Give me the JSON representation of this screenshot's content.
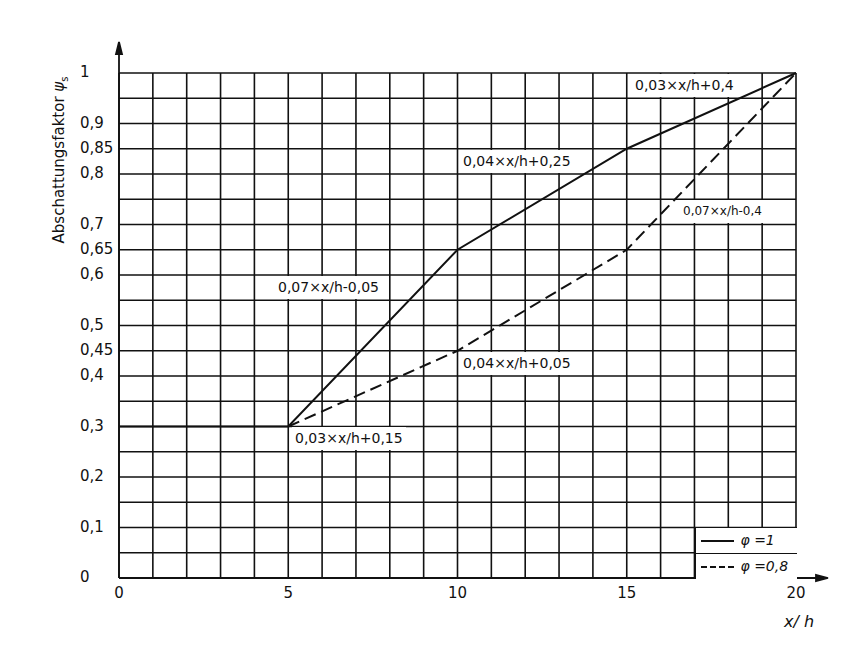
{
  "chart_data": {
    "type": "line",
    "title": "",
    "xlabel": "x/h",
    "ylabel": "Abschattungsfaktor ψs",
    "xlim": [
      0,
      20
    ],
    "ylim": [
      0,
      1
    ],
    "grid": true,
    "x_grid_step": 1,
    "y_grid_step": 0.05,
    "x_ticks": [
      "0",
      "5",
      "10",
      "15",
      "20"
    ],
    "y_ticks": [
      {
        "value": 0,
        "label": "0"
      },
      {
        "value": 0.1,
        "label": "0,1"
      },
      {
        "value": 0.2,
        "label": "0,2"
      },
      {
        "value": 0.3,
        "label": "0,3"
      },
      {
        "value": 0.4,
        "label": "0,4"
      },
      {
        "value": 0.45,
        "label": "0,45"
      },
      {
        "value": 0.5,
        "label": "0,5"
      },
      {
        "value": 0.6,
        "label": "0,6"
      },
      {
        "value": 0.65,
        "label": "0,65"
      },
      {
        "value": 0.7,
        "label": "0,7"
      },
      {
        "value": 0.8,
        "label": "0,8"
      },
      {
        "value": 0.85,
        "label": "0,85"
      },
      {
        "value": 0.9,
        "label": "0,9"
      },
      {
        "value": 1,
        "label": "1"
      }
    ],
    "series": [
      {
        "name": "φ =1",
        "style": "solid",
        "points": [
          [
            0,
            0.3
          ],
          [
            5,
            0.3
          ],
          [
            10,
            0.65
          ],
          [
            15,
            0.85
          ],
          [
            20,
            1.0
          ]
        ]
      },
      {
        "name": "φ =0,8",
        "style": "dashed",
        "points": [
          [
            5,
            0.3
          ],
          [
            10,
            0.45
          ],
          [
            15,
            0.65
          ],
          [
            20,
            1.0
          ]
        ]
      }
    ],
    "annotations": [
      {
        "text": "0,03×x/h+0,4",
        "segment": "φ=1, 15–20"
      },
      {
        "text": "0,04×x/h+0,25",
        "segment": "φ=1, 10–15"
      },
      {
        "text": "0,07×x/h-0,05",
        "segment": "φ=1, 5–10"
      },
      {
        "text": "0,07×x/h-0,4",
        "segment": "φ=0,8, 15–20"
      },
      {
        "text": "0,04×x/h+0,05",
        "segment": "φ=0,8, 10–15"
      },
      {
        "text": "0,03×x/h+0,15",
        "segment": "φ=0,8, 5–10"
      }
    ],
    "legend": {
      "position": "lower right",
      "entries": [
        {
          "label": "φ =1",
          "style": "solid"
        },
        {
          "label": "φ =0,8",
          "style": "dashed"
        }
      ]
    }
  },
  "axes": {
    "ylabel_main": "Abschattungsfaktor ",
    "ylabel_symbol": "ψ",
    "ylabel_sub": "s",
    "xlabel": "x/ h"
  },
  "annotations": {
    "a1": "0,03×x/h+0,4",
    "a2": "0,04×x/h+0,25",
    "a3": "0,07×x/h-0,05",
    "a4": "0,07×x/h-0,4",
    "a5": "0,04×x/h+0,05",
    "a6": "0,03×x/h+0,15"
  },
  "legend": {
    "solid_label": "φ =1",
    "dashed_label": "φ =0,8"
  },
  "colors": {
    "ink": "#111111",
    "background": "#ffffff"
  }
}
